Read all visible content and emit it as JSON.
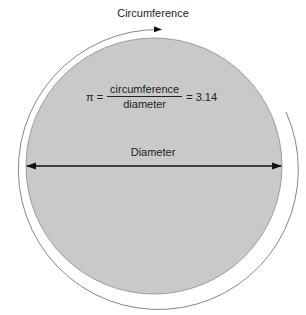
{
  "labels": {
    "circumference": "Circumference",
    "diameter": "Diameter"
  },
  "formula": {
    "lhs": "π =",
    "numerator": "circumference",
    "denominator": "diameter",
    "rhs": "= 3.14"
  },
  "colors": {
    "disk_fill": "#c8c8c8",
    "disk_stroke": "#888888",
    "outer_arc": "#777777",
    "arrow": "#111111"
  }
}
